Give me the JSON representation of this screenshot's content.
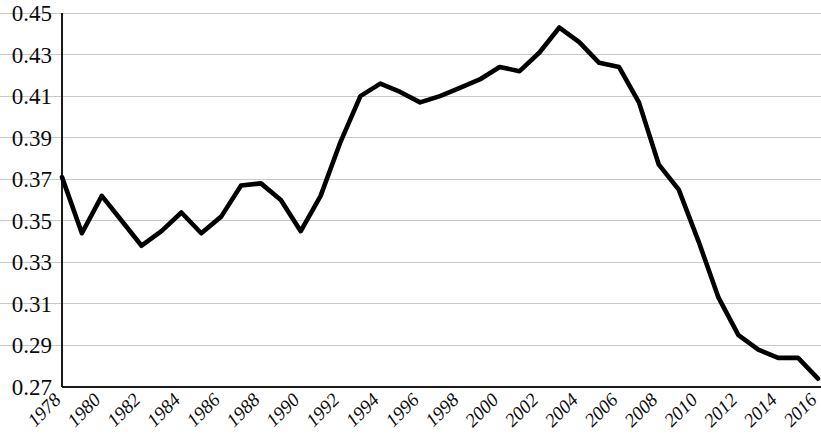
{
  "chart_data": {
    "type": "line",
    "title": "",
    "subtitle": "",
    "xlabel": "",
    "ylabel": "",
    "grid": "horizontal",
    "legend": "none",
    "xlim": [
      1978,
      2016
    ],
    "ylim": [
      0.27,
      0.45
    ],
    "ytick_step": 0.02,
    "xtick_step": 2,
    "ytick_labels": [
      "0.45",
      "0.43",
      "0.41",
      "0.39",
      "0.37",
      "0.35",
      "0.33",
      "0.31",
      "0.29",
      "0.27"
    ],
    "ytick_values": [
      0.45,
      0.43,
      0.41,
      0.39,
      0.37,
      0.35,
      0.33,
      0.31,
      0.29,
      0.27
    ],
    "xtick_labels": [
      "1978",
      "1980",
      "1982",
      "1984",
      "1986",
      "1988",
      "1990",
      "1992",
      "1994",
      "1996",
      "1998",
      "2000",
      "2002",
      "2004",
      "2006",
      "2008",
      "2010",
      "2012",
      "2014",
      "2016"
    ],
    "xtick_values": [
      1978,
      1980,
      1982,
      1984,
      1986,
      1988,
      1990,
      1992,
      1994,
      1996,
      1998,
      2000,
      2002,
      2004,
      2006,
      2008,
      2010,
      2012,
      2014,
      2016
    ],
    "x": [
      1978,
      1979,
      1980,
      1981,
      1982,
      1983,
      1984,
      1985,
      1986,
      1987,
      1988,
      1989,
      1990,
      1991,
      1992,
      1993,
      1994,
      1995,
      1996,
      1997,
      1998,
      1999,
      2000,
      2001,
      2002,
      2003,
      2004,
      2005,
      2006,
      2007,
      2008,
      2009,
      2010,
      2011,
      2012,
      2013,
      2014,
      2015,
      2016
    ],
    "values": [
      0.371,
      0.344,
      0.362,
      0.35,
      0.338,
      0.345,
      0.354,
      0.344,
      0.352,
      0.367,
      0.368,
      0.36,
      0.345,
      0.362,
      0.388,
      0.41,
      0.416,
      0.412,
      0.407,
      0.41,
      0.414,
      0.418,
      0.424,
      0.422,
      0.431,
      0.443,
      0.436,
      0.426,
      0.424,
      0.407,
      0.377,
      0.365,
      0.34,
      0.313,
      0.295,
      0.288,
      0.284,
      0.284,
      0.274
    ],
    "series": [
      {
        "name": "series-1",
        "color": "#000000",
        "line_width": 4.6,
        "marker": "none",
        "values": [
          0.371,
          0.344,
          0.362,
          0.35,
          0.338,
          0.345,
          0.354,
          0.344,
          0.352,
          0.367,
          0.368,
          0.36,
          0.345,
          0.362,
          0.388,
          0.41,
          0.416,
          0.412,
          0.407,
          0.41,
          0.414,
          0.418,
          0.424,
          0.422,
          0.431,
          0.443,
          0.436,
          0.426,
          0.424,
          0.407,
          0.377,
          0.365,
          0.34,
          0.313,
          0.295,
          0.288,
          0.284,
          0.284,
          0.274
        ]
      }
    ]
  },
  "colors": {
    "line": "#000000",
    "grid": "#c8c8c8",
    "axis": "#1a1a1a",
    "background": "#ffffff",
    "text": "#0b0b0b"
  }
}
